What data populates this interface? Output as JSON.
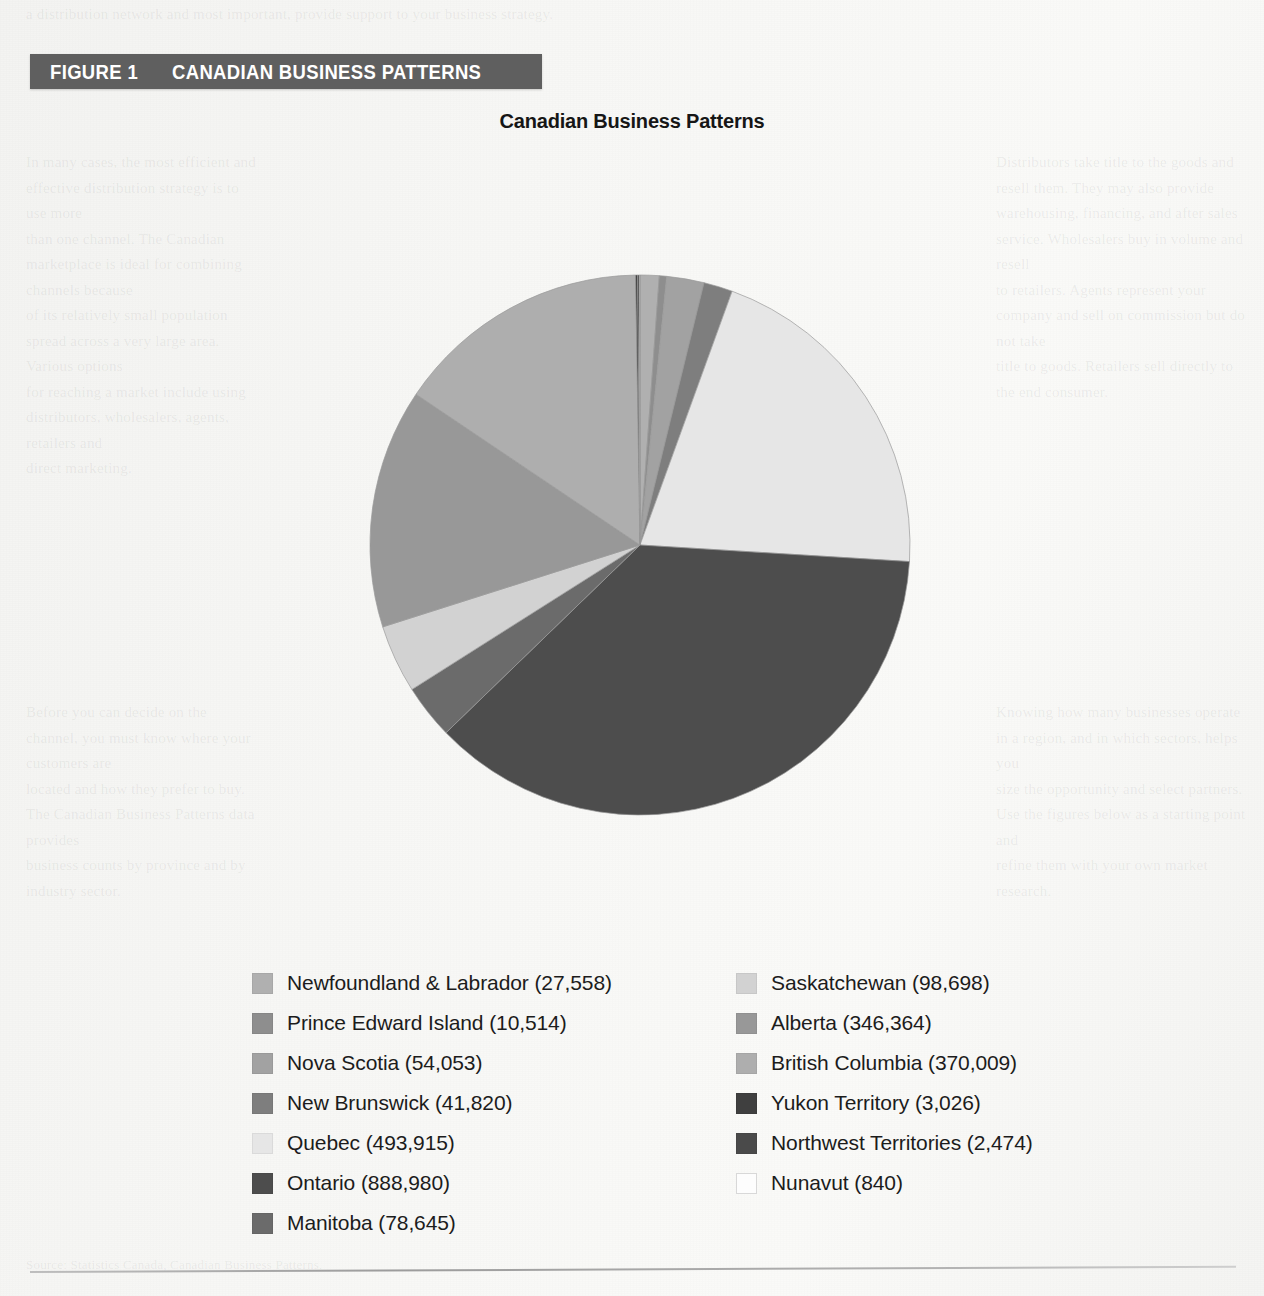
{
  "figure": {
    "label": "FIGURE 1",
    "title": "CANADIAN BUSINESS PATTERNS",
    "banner_color": "#5f5f5f",
    "banner_text_color": "#ffffff"
  },
  "chart_title": "Canadian Business Patterns",
  "bleed_text": {
    "top": "a distribution network and most important, provide support to your business strategy.",
    "left": "In many cases, the most efficient and effective distribution strategy is to use more\nthan one channel. The Canadian marketplace is ideal for combining channels because\nof its relatively small population spread across a very large area. Various options\nfor reaching a market include using distributors, wholesalers, agents, retailers and\ndirect marketing.",
    "right": "Distributors take title to the goods and resell them. They may also provide\nwarehousing, financing, and after sales service. Wholesalers buy in volume and resell\nto retailers. Agents represent your company and sell on commission but do not take\ntitle to goods. Retailers sell directly to the end consumer.",
    "mid": "Before you can decide on the channel, you must know where your customers are\nlocated and how they prefer to buy. The Canadian Business Patterns data provides\nbusiness counts by province and by industry sector.",
    "midr": "Knowing how many businesses operate in a region, and in which sectors, helps you\nsize the opportunity and select partners. Use the figures below as a starting point and\nrefine them with your own market research.",
    "bottom": "Source: Statistics Canada, Canadian Business Patterns."
  },
  "chart_data": {
    "type": "pie",
    "title": "Canadian Business Patterns",
    "unit": "number of businesses",
    "start_angle_deg": 0,
    "direction": "clockwise",
    "legend_position": "bottom",
    "total": 2416898,
    "categories": [
      "Newfoundland & Labrador",
      "Prince Edward Island",
      "Nova Scotia",
      "New Brunswick",
      "Quebec",
      "Ontario",
      "Manitoba",
      "Saskatchewan",
      "Alberta",
      "British Columbia",
      "Yukon Territory",
      "Northwest Territories",
      "Nunavut"
    ],
    "values": [
      27558,
      10514,
      54053,
      41820,
      493915,
      888980,
      78645,
      98698,
      346364,
      370009,
      3026,
      2474,
      840
    ],
    "colors": [
      "#b0b0b0",
      "#8e8e8e",
      "#a2a2a2",
      "#7e7e7e",
      "#e6e6e6",
      "#4d4d4d",
      "#6b6b6b",
      "#d2d2d2",
      "#989898",
      "#aeaeae",
      "#3f3f3f",
      "#4a4a4a",
      "#fdfdfd"
    ],
    "labels": [
      "Newfoundland & Labrador (27,558)",
      "Prince Edward Island (10,514)",
      "Nova Scotia (54,053)",
      "New Brunswick (41,820)",
      "Quebec (493,915)",
      "Ontario (888,980)",
      "Manitoba (78,645)",
      "Saskatchewan (98,698)",
      "Alberta (346,364)",
      "British Columbia (370,009)",
      "Yukon Territory (3,026)",
      "Northwest Territories (2,474)",
      "Nunavut (840)"
    ]
  },
  "legend": {
    "left_column": [
      {
        "label": "Newfoundland & Labrador (27,558)",
        "color": "#b0b0b0"
      },
      {
        "label": "Prince Edward Island (10,514)",
        "color": "#8e8e8e"
      },
      {
        "label": "Nova Scotia (54,053)",
        "color": "#a2a2a2"
      },
      {
        "label": "New Brunswick (41,820)",
        "color": "#7e7e7e"
      },
      {
        "label": "Quebec (493,915)",
        "color": "#e6e6e6"
      },
      {
        "label": "Ontario (888,980)",
        "color": "#4d4d4d"
      },
      {
        "label": "Manitoba (78,645)",
        "color": "#6b6b6b"
      }
    ],
    "right_column": [
      {
        "label": "Saskatchewan (98,698)",
        "color": "#d2d2d2"
      },
      {
        "label": "Alberta (346,364)",
        "color": "#989898"
      },
      {
        "label": "British Columbia (370,009)",
        "color": "#aeaeae"
      },
      {
        "label": "Yukon Territory (3,026)",
        "color": "#3f3f3f"
      },
      {
        "label": "Northwest Territories (2,474)",
        "color": "#4a4a4a"
      },
      {
        "label": "Nunavut (840)",
        "color": "#fdfdfd"
      }
    ]
  }
}
